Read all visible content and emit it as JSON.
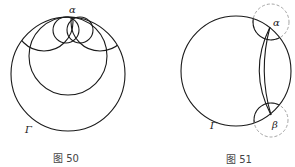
{
  "figures": [
    {
      "caption": "图 50",
      "labels": {
        "top_point": "α",
        "big_circle": "Γ"
      }
    },
    {
      "caption": "图 51",
      "labels": {
        "top_point": "α",
        "bottom_point": "β",
        "big_circle": "Γ"
      }
    }
  ],
  "colors": {
    "line": "#1a1a1a",
    "dashed": "#9a9a9a",
    "caption": "#444444"
  }
}
